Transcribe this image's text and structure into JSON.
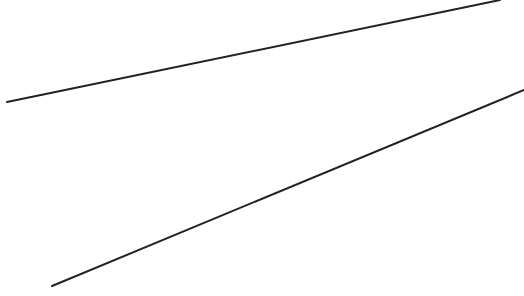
{
  "canvas": {
    "width": 524,
    "height": 296,
    "background": "#ffffff"
  },
  "lines": [
    {
      "id": "upper-line",
      "x1": 7,
      "y1": 102,
      "x2": 500,
      "y2": 0,
      "stroke": "#222222",
      "stroke_width": 2
    },
    {
      "id": "lower-line",
      "x1": 52,
      "y1": 286,
      "x2": 524,
      "y2": 90,
      "stroke": "#222222",
      "stroke_width": 2
    }
  ]
}
